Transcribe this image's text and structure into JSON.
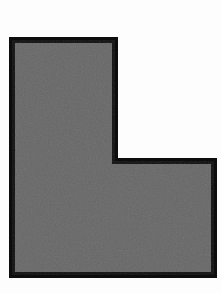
{
  "figure": {
    "description": "A solid gray L-shaped hexagonal block outlined with a thick black border on a plain white background.",
    "shape_type": "l-shape-polygon",
    "background_color": "#fdfdfd",
    "fill_color": "#676767",
    "stroke_color": "#0d0d0d",
    "stroke_width": 6,
    "canvas": {
      "width": 221,
      "height": 294
    },
    "vertices": [
      {
        "label": "top-left",
        "x": 12,
        "y": 40
      },
      {
        "label": "top-right",
        "x": 115,
        "y": 40
      },
      {
        "label": "notch-inner-top",
        "x": 115,
        "y": 161
      },
      {
        "label": "notch-right",
        "x": 214,
        "y": 161
      },
      {
        "label": "bottom-right",
        "x": 214,
        "y": 275
      },
      {
        "label": "bottom-left",
        "x": 12,
        "y": 275
      }
    ],
    "points_attr": "12,40 115,40 115,161 214,161 214,275 12,275"
  }
}
